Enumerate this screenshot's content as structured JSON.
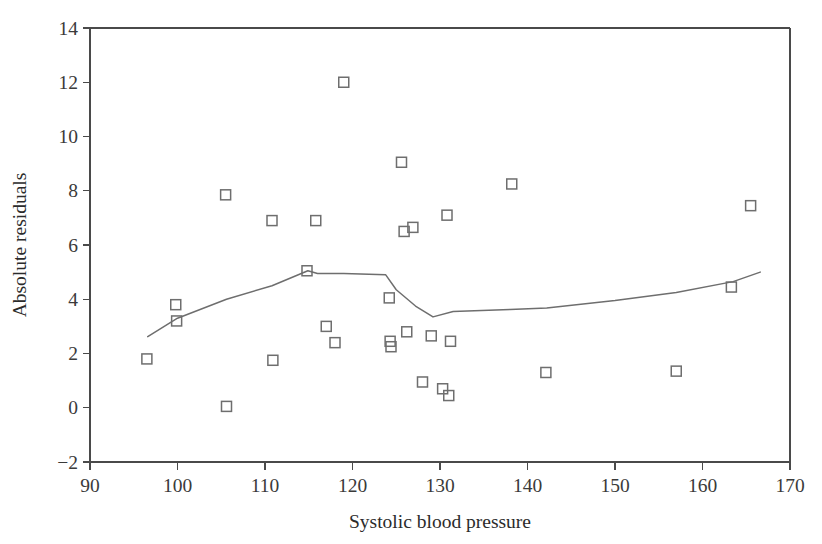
{
  "chart_data": {
    "type": "scatter",
    "title": "",
    "subtitle": "",
    "xlabel": "Systolic blood pressure",
    "ylabel": "Absolute residuals",
    "xlim": [
      90,
      170
    ],
    "ylim": [
      -2,
      14
    ],
    "xticks": [
      90,
      100,
      110,
      120,
      130,
      140,
      150,
      160,
      170
    ],
    "yticks": [
      -2,
      0,
      2,
      4,
      6,
      8,
      10,
      12,
      14
    ],
    "xtick_labels": [
      "90",
      "100",
      "110",
      "120",
      "130",
      "140",
      "150",
      "160",
      "170"
    ],
    "ytick_labels": [
      "-2",
      "0",
      "2",
      "4",
      "6",
      "8",
      "10",
      "12",
      "14"
    ],
    "grid": false,
    "legend": false,
    "legend_position": "none",
    "marker_style": "open-square",
    "marker_color": "#6e6e6e",
    "line_color": "#6e6e6e",
    "background_color": "#ffffff",
    "axis_color": "#4a4a4a",
    "series": [
      {
        "name": "Absolute residuals",
        "type": "scatter",
        "points": [
          {
            "x": 96.5,
            "y": 1.8
          },
          {
            "x": 99.8,
            "y": 3.8
          },
          {
            "x": 99.9,
            "y": 3.2
          },
          {
            "x": 105.5,
            "y": 7.85
          },
          {
            "x": 105.6,
            "y": 0.05
          },
          {
            "x": 110.8,
            "y": 6.9
          },
          {
            "x": 110.9,
            "y": 1.75
          },
          {
            "x": 114.8,
            "y": 5.05
          },
          {
            "x": 115.8,
            "y": 6.9
          },
          {
            "x": 117.0,
            "y": 3.0
          },
          {
            "x": 118.0,
            "y": 2.4
          },
          {
            "x": 119.0,
            "y": 12.0
          },
          {
            "x": 124.2,
            "y": 4.05
          },
          {
            "x": 124.3,
            "y": 2.45
          },
          {
            "x": 124.4,
            "y": 2.25
          },
          {
            "x": 125.6,
            "y": 9.05
          },
          {
            "x": 125.9,
            "y": 6.5
          },
          {
            "x": 126.9,
            "y": 6.65
          },
          {
            "x": 126.2,
            "y": 2.8
          },
          {
            "x": 128.0,
            "y": 0.95
          },
          {
            "x": 129.0,
            "y": 2.65
          },
          {
            "x": 130.3,
            "y": 0.7
          },
          {
            "x": 130.8,
            "y": 7.1
          },
          {
            "x": 131.0,
            "y": 0.45
          },
          {
            "x": 131.2,
            "y": 2.45
          },
          {
            "x": 138.2,
            "y": 8.25
          },
          {
            "x": 142.1,
            "y": 1.3
          },
          {
            "x": 157.0,
            "y": 1.35
          },
          {
            "x": 163.3,
            "y": 4.45
          },
          {
            "x": 165.5,
            "y": 7.45
          }
        ]
      },
      {
        "name": "Lowess trend",
        "type": "line",
        "points": [
          {
            "x": 96.6,
            "y": 2.62
          },
          {
            "x": 100.0,
            "y": 3.3
          },
          {
            "x": 105.6,
            "y": 4.0
          },
          {
            "x": 110.8,
            "y": 4.5
          },
          {
            "x": 114.9,
            "y": 5.05
          },
          {
            "x": 116.0,
            "y": 4.95
          },
          {
            "x": 119.0,
            "y": 4.95
          },
          {
            "x": 123.8,
            "y": 4.9
          },
          {
            "x": 125.0,
            "y": 4.35
          },
          {
            "x": 127.2,
            "y": 3.75
          },
          {
            "x": 129.2,
            "y": 3.35
          },
          {
            "x": 131.5,
            "y": 3.55
          },
          {
            "x": 138.0,
            "y": 3.62
          },
          {
            "x": 142.2,
            "y": 3.68
          },
          {
            "x": 150.0,
            "y": 3.95
          },
          {
            "x": 157.0,
            "y": 4.25
          },
          {
            "x": 163.5,
            "y": 4.65
          },
          {
            "x": 166.6,
            "y": 5.0
          }
        ]
      }
    ]
  },
  "axes": {
    "x_title": "Systolic blood pressure",
    "y_title": "Absolute residuals"
  }
}
